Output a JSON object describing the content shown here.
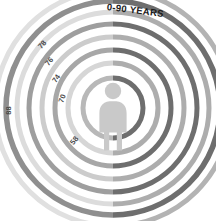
{
  "figure": {
    "type": "radial-rings-infographic",
    "title": "0-90 YEARS",
    "background_color": "#ffffff",
    "center_icon": "person-icon",
    "center_icon_color": "#c9c9c9"
  },
  "chart_data": {
    "type": "pie",
    "title": "0-90 YEARS",
    "xlabel": "",
    "ylabel": "",
    "categories": [
      "88",
      "78",
      "76",
      "74",
      "70",
      "58"
    ],
    "values": [
      88,
      78,
      76,
      74,
      70,
      58
    ],
    "labels": [
      "88",
      "78",
      "76",
      "74",
      "70",
      "58"
    ],
    "legend": [],
    "grid": false
  },
  "rings": [
    {
      "index": 0,
      "label": "58",
      "radius": 30,
      "stroke": 5.0,
      "color_right": "#6e6e6e",
      "color_left": "#b8b8b8",
      "label_x": 70,
      "label_y": 136,
      "label_rot": -52
    },
    {
      "index": 1,
      "label": "70",
      "radius": 45,
      "stroke": 5.0,
      "color_right": "#adadad",
      "color_left": "#d6d6d6",
      "label_x": 58,
      "label_y": 94,
      "label_rot": -70
    },
    {
      "index": 2,
      "label": "74",
      "radius": 58,
      "stroke": 5.0,
      "color_right": "#6e6e6e",
      "color_left": "#a7a7a7",
      "label_x": 52,
      "label_y": 74,
      "label_rot": -56
    },
    {
      "index": 3,
      "label": "76",
      "radius": 71,
      "stroke": 5.0,
      "color_right": "#adadad",
      "color_left": "#cccccc",
      "label_x": 45,
      "label_y": 57,
      "label_rot": -50
    },
    {
      "index": 4,
      "label": "78",
      "radius": 84,
      "stroke": 5.0,
      "color_right": "#6e6e6e",
      "color_left": "#9e9e9e",
      "label_x": 38,
      "label_y": 40,
      "label_rot": -48
    },
    {
      "index": 5,
      "label": "88",
      "radius": 107,
      "stroke": 5.5,
      "color_right": "#6e6e6e",
      "color_left": "#8f8f8f",
      "label_x": 4,
      "label_y": 106,
      "label_rot": -90
    }
  ],
  "extra_rings": [
    {
      "index": 6,
      "radius": 96,
      "stroke": 5.0,
      "color_right": "#adadad",
      "color_left": "#dcdcdc"
    },
    {
      "index": 7,
      "radius": 118,
      "stroke": 5.0,
      "color_right": "#b3b3b3",
      "color_left": "#e0e0e0"
    }
  ],
  "center": {
    "cx": 113,
    "cy": 108
  }
}
